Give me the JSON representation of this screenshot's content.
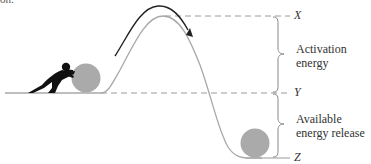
{
  "fragment_text": "on.",
  "labels": {
    "x": "X",
    "y": "Y",
    "z": "Z",
    "activation_line1": "Activation",
    "activation_line2": "energy",
    "available_line1": "Available",
    "available_line2": "energy release"
  },
  "colors": {
    "curve": "#a8a8a8",
    "arrow": "#222222",
    "dashed": "#9a9a9a",
    "ball": "#aaaaaa",
    "figure": "#111111",
    "brace": "#888888",
    "text": "#333333"
  }
}
